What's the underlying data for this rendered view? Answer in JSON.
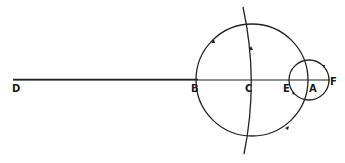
{
  "diagram": {
    "type": "geometric-construction",
    "colors": {
      "line": "#222222",
      "background": "#ffffff"
    },
    "baseline": {
      "from": "D",
      "to": "F"
    },
    "points": [
      {
        "id": "D",
        "label": "D",
        "x": 13,
        "y": 80
      },
      {
        "id": "B",
        "label": "B",
        "x": 198,
        "y": 80
      },
      {
        "id": "C",
        "label": "C",
        "x": 251,
        "y": 80
      },
      {
        "id": "E",
        "label": "E",
        "x": 289,
        "y": 80
      },
      {
        "id": "A",
        "label": "A",
        "x": 308,
        "y": 80
      },
      {
        "id": "F",
        "label": "F",
        "x": 329,
        "y": 80
      }
    ],
    "circles": [
      {
        "id": "large-circle",
        "cx": 252,
        "cy": 80,
        "r": 56,
        "arrows": "counterclockwise"
      },
      {
        "id": "small-circle",
        "cx": 309,
        "cy": 80,
        "r": 20,
        "arrows": "clockwise"
      }
    ],
    "arc": {
      "id": "vertical-arc",
      "through": "C",
      "direction": "upward"
    }
  }
}
